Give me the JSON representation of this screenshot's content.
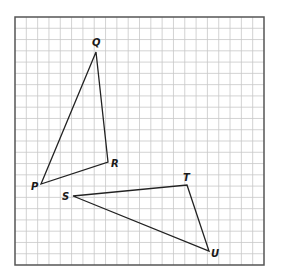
{
  "diagram": {
    "grid": {
      "left": 15,
      "top": 17,
      "right": 264,
      "bottom": 265,
      "cols": 22,
      "rows": 22,
      "line_color": "#c8c8c8",
      "border_color": "#555555"
    },
    "triangles": [
      {
        "name": "PQR",
        "vertices": [
          {
            "label": "P",
            "x": 41,
            "y": 184,
            "lx": 31,
            "ly": 190
          },
          {
            "label": "Q",
            "x": 96,
            "y": 52,
            "lx": 92,
            "ly": 46
          },
          {
            "label": "R",
            "x": 108,
            "y": 162,
            "lx": 111,
            "ly": 167
          }
        ]
      },
      {
        "name": "STU",
        "vertices": [
          {
            "label": "S",
            "x": 73,
            "y": 196,
            "lx": 62,
            "ly": 200
          },
          {
            "label": "T",
            "x": 187,
            "y": 185,
            "lx": 183,
            "ly": 181
          },
          {
            "label": "U",
            "x": 209,
            "y": 251,
            "lx": 211,
            "ly": 257
          }
        ]
      }
    ],
    "labels": {
      "P": "P",
      "Q": "Q",
      "R": "R",
      "S": "S",
      "T": "T",
      "U": "U"
    },
    "line_color": "#222222"
  }
}
